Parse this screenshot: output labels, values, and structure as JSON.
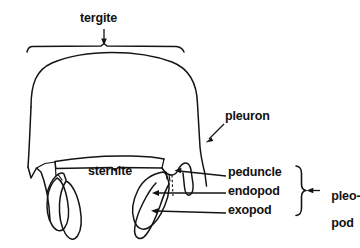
{
  "figure": {
    "background_color": "#ffffff",
    "ink_color": "#141414"
  },
  "labels": {
    "tergite": "tergite",
    "pleuron": "pleuron",
    "sternite": "sternite",
    "peduncle": "peduncle",
    "endopod": "endopod",
    "exopod": "exopod",
    "pleopod_line1": "pleo-",
    "pleopod_line2": "pod"
  },
  "annotations": {
    "tergite_marker": "bracket-with-down-arrow",
    "pleuron_marker": "diagonal-arrow",
    "sternite_marker": "bracket",
    "peduncle_marker": "leader-arrow",
    "endopod_marker": "leader-arrow",
    "exopod_marker": "leader-arrow",
    "pleopod_marker": "curly-brace-with-left-arrow"
  },
  "structures": [
    "tergite-dome",
    "pleuron-lateral-wall",
    "sternite-arc",
    "left-pleopod-peduncle",
    "left-pleopod-endopod",
    "left-pleopod-exopod",
    "right-pleopod-peduncle",
    "right-pleopod-endopod",
    "right-pleopod-exopod"
  ]
}
